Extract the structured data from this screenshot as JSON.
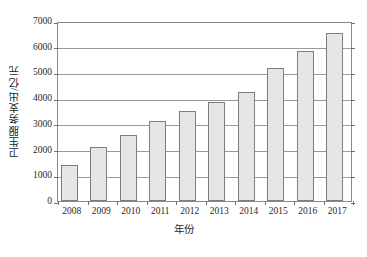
{
  "chart_data": {
    "type": "bar",
    "title": "",
    "xlabel": "年份",
    "ylabel": "卫生服务支出/亿元",
    "categories": [
      "2008",
      "2009",
      "2010",
      "2011",
      "2012",
      "2013",
      "2014",
      "2015",
      "2016",
      "2017"
    ],
    "values": [
      1400,
      2100,
      2550,
      3120,
      3500,
      3840,
      4250,
      5180,
      5850,
      6520
    ],
    "ylim": [
      0,
      7000
    ],
    "yticks": [
      0,
      1000,
      2000,
      3000,
      4000,
      5000,
      6000,
      7000
    ],
    "ytick_labels": [
      "0",
      "1000",
      "2000",
      "3000",
      "4000",
      "5000",
      "6000",
      "7000"
    ],
    "grid": true,
    "legend": false,
    "series": [
      {
        "name": "卫生服务支出",
        "values": [
          1400,
          2100,
          2550,
          3120,
          3500,
          3840,
          4250,
          5180,
          5850,
          6520
        ]
      }
    ],
    "colors": {
      "bar_fill": "#e6e6e6",
      "bar_border": "#7d7d7d",
      "gridline": "#9a9a9a",
      "axis": "#8a8a8a",
      "text": "#1f1f1f",
      "background": "#ffffff"
    }
  }
}
